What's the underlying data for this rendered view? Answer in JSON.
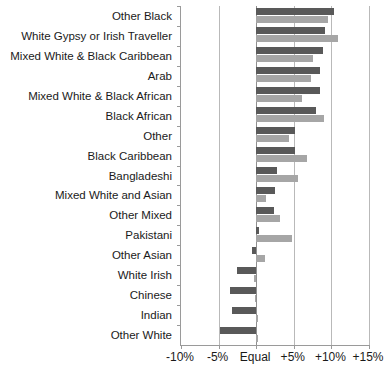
{
  "chart_data": {
    "type": "bar",
    "orientation": "horizontal",
    "title": "",
    "subtitle": "",
    "xlabel": "",
    "ylabel": "",
    "xlim": [
      -10,
      15
    ],
    "grid": true,
    "legend": null,
    "tick_labels": [
      "-10%",
      "-5%",
      "Equal",
      "+5%",
      "+10%",
      "+15%"
    ],
    "tick_values": [
      -10,
      -5,
      0,
      5,
      10,
      15
    ],
    "colors": {
      "series_1": "#595959",
      "series_2": "#a6a6a6",
      "gridline": "#b9b9b9",
      "axis": "#9a9a9a",
      "background": "#ffffff"
    },
    "categories": [
      "Other Black",
      "White Gypsy or Irish Traveller",
      "Mixed White & Black Caribbean",
      "Arab",
      "Mixed White & Black African",
      "Black African",
      "Other",
      "Black Caribbean",
      "Bangladeshi",
      "Mixed White and Asian",
      "Other Mixed",
      "Pakistani",
      "Other Asian",
      "White Irish",
      "Chinese",
      "Indian",
      "Other White"
    ],
    "series": [
      {
        "name": "series_1",
        "color": "#595959",
        "values": [
          10.3,
          9.2,
          8.9,
          8.5,
          8.5,
          8.0,
          5.1,
          5.2,
          2.8,
          2.5,
          2.4,
          0.4,
          -0.5,
          -2.6,
          -3.5,
          -3.2,
          -4.8
        ]
      },
      {
        "name": "series_2",
        "color": "#a6a6a6",
        "values": [
          9.6,
          10.9,
          7.6,
          7.3,
          6.1,
          9.0,
          4.3,
          6.8,
          5.6,
          1.3,
          3.2,
          4.7,
          1.2,
          -0.3,
          -0.1,
          0.3,
          0.2
        ]
      }
    ]
  }
}
